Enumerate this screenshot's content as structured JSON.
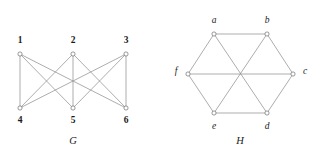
{
  "figure": {
    "background_color": "#ffffff",
    "edge_color": "#8a8a8a",
    "vertex_stroke_color": "#6e6e6e",
    "vertex_fill_color": "#ffffff",
    "label_color": "#1a1a1a",
    "width": 315,
    "height": 159
  },
  "graphs": [
    {
      "id": "G",
      "caption": "G",
      "caption_pos": {
        "x": 73,
        "y": 142
      },
      "type": "bipartite",
      "description": "complete bipartite graph K(3,3)",
      "vertices": [
        {
          "id": "1",
          "label": "1",
          "x": 20,
          "y": 54,
          "label_x": 20,
          "label_y": 41,
          "style": "bold"
        },
        {
          "id": "2",
          "label": "2",
          "x": 73,
          "y": 54,
          "label_x": 73,
          "label_y": 41,
          "style": "bold"
        },
        {
          "id": "3",
          "label": "3",
          "x": 126,
          "y": 54,
          "label_x": 126,
          "label_y": 41,
          "style": "bold"
        },
        {
          "id": "4",
          "label": "4",
          "x": 20,
          "y": 108,
          "label_x": 20,
          "label_y": 121,
          "style": "bold"
        },
        {
          "id": "5",
          "label": "5",
          "x": 73,
          "y": 108,
          "label_x": 73,
          "label_y": 121,
          "style": "bold"
        },
        {
          "id": "6",
          "label": "6",
          "x": 126,
          "y": 108,
          "label_x": 126,
          "label_y": 121,
          "style": "bold"
        }
      ],
      "edges": [
        {
          "from": "1",
          "to": "4"
        },
        {
          "from": "1",
          "to": "5"
        },
        {
          "from": "1",
          "to": "6"
        },
        {
          "from": "2",
          "to": "4"
        },
        {
          "from": "2",
          "to": "5"
        },
        {
          "from": "2",
          "to": "6"
        },
        {
          "from": "3",
          "to": "4"
        },
        {
          "from": "3",
          "to": "5"
        },
        {
          "from": "3",
          "to": "6"
        }
      ]
    },
    {
      "id": "H",
      "caption": "H",
      "caption_pos": {
        "x": 240,
        "y": 142
      },
      "type": "hexagonal",
      "description": "hexagon with three long diagonals",
      "vertices": [
        {
          "id": "a",
          "label": "a",
          "x": 214,
          "y": 34,
          "label_x": 214,
          "label_y": 21,
          "style": "italic"
        },
        {
          "id": "b",
          "label": "b",
          "x": 267,
          "y": 34,
          "label_x": 267,
          "label_y": 21,
          "style": "italic"
        },
        {
          "id": "c",
          "label": "c",
          "x": 293,
          "y": 74,
          "label_x": 305,
          "label_y": 72,
          "style": "italic"
        },
        {
          "id": "d",
          "label": "d",
          "x": 267,
          "y": 113,
          "label_x": 267,
          "label_y": 127,
          "style": "italic"
        },
        {
          "id": "e",
          "label": "e",
          "x": 214,
          "y": 113,
          "label_x": 214,
          "label_y": 127,
          "style": "italic"
        },
        {
          "id": "f",
          "label": "f",
          "x": 188,
          "y": 74,
          "label_x": 176,
          "label_y": 72,
          "style": "italic"
        }
      ],
      "edges": [
        {
          "from": "a",
          "to": "b"
        },
        {
          "from": "b",
          "to": "c"
        },
        {
          "from": "c",
          "to": "d"
        },
        {
          "from": "d",
          "to": "e"
        },
        {
          "from": "e",
          "to": "f"
        },
        {
          "from": "f",
          "to": "a"
        },
        {
          "from": "a",
          "to": "d"
        },
        {
          "from": "b",
          "to": "e"
        },
        {
          "from": "c",
          "to": "f"
        }
      ]
    }
  ],
  "vertex_radius": 2.1
}
